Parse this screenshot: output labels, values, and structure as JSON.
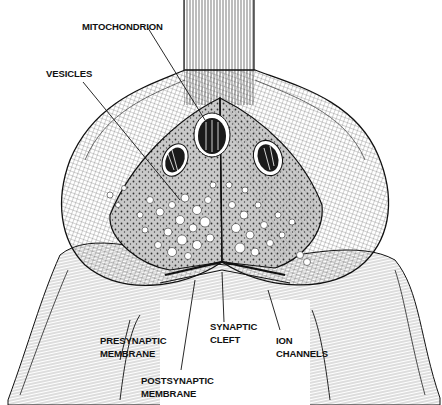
{
  "figure": {
    "style": "pen-and-ink hatching",
    "colors": {
      "ink": "#111111",
      "background": "#ffffff",
      "vesicle_fill": "#ffffff"
    }
  },
  "labels": {
    "mitochondrion": {
      "lines": [
        "MITOCHONDRION"
      ]
    },
    "vesicles": {
      "lines": [
        "VESICLES"
      ]
    },
    "presynaptic_membrane": {
      "lines": [
        "PRESYNAPTIC",
        "MEMBRANE"
      ]
    },
    "synaptic_cleft": {
      "lines": [
        "SYNAPTIC",
        "CLEFT"
      ]
    },
    "ion_channels": {
      "lines": [
        "ION",
        "CHANNELS"
      ]
    },
    "postsynaptic_membrane": {
      "lines": [
        "POSTSYNAPTIC",
        "MEMBRANE"
      ]
    }
  }
}
